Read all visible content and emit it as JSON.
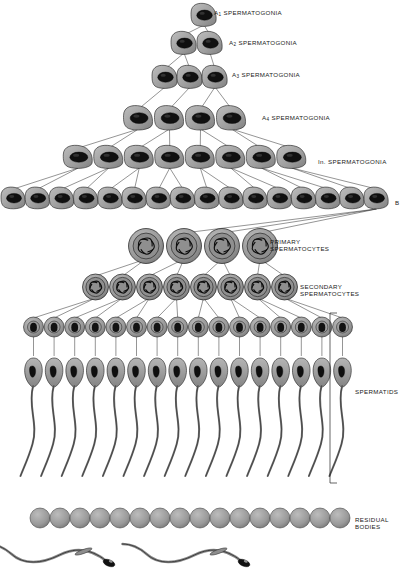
{
  "figure": {
    "style": {
      "cytoplasm_fill": "#9a9a9a",
      "cytoplasm_stroke": "#1a1a1a",
      "nucleus_fill": "#111111",
      "background": "#ffffff",
      "line_color": "#222222"
    }
  },
  "labels": [
    {
      "id": "a1",
      "text": "A",
      "sub": "1",
      "suffix": " SPERMATOGONIA",
      "x": 214,
      "y": 9,
      "lines": [
        "A₁  SPERMATOGONIA"
      ]
    },
    {
      "id": "a2",
      "text": "A",
      "sub": "2",
      "suffix": " SPERMATOGONIA",
      "x": 229,
      "y": 39,
      "lines": [
        "A₂  SPERMATOGONIA"
      ]
    },
    {
      "id": "a3",
      "text": "A",
      "sub": "3",
      "suffix": " SPERMATOGONIA",
      "x": 232,
      "y": 71,
      "lines": [
        "A₃  SPERMATOGONIA"
      ]
    },
    {
      "id": "a4",
      "text": "A",
      "sub": "4",
      "suffix": " SPERMATOGONIA",
      "x": 262,
      "y": 114,
      "lines": [
        "A₄  SPERMATOGONIA"
      ]
    },
    {
      "id": "intermediate",
      "text": "In.",
      "sub": "",
      "suffix": " SPERMATOGONIA",
      "x": 318,
      "y": 158,
      "lines": [
        "In.  SPERMATOGONIA"
      ]
    },
    {
      "id": "b",
      "text": "B",
      "sub": "",
      "suffix": "",
      "x": 395,
      "y": 199,
      "lines": [
        "B"
      ]
    }
  ],
  "stage_labels": [
    {
      "id": "primary-spermatocytes",
      "line1": "PRIMARY",
      "line2": "SPERMATOCYTES",
      "x": 270,
      "y": 238
    },
    {
      "id": "secondary-spermatocytes",
      "line1": "SECONDARY",
      "line2": "SPERMATOCYTES",
      "x": 300,
      "y": 283
    },
    {
      "id": "spermatids",
      "line1": "SPERMATIDS",
      "line2": "",
      "x": 355,
      "y": 388
    },
    {
      "id": "residual-bodies",
      "line1": "RESIDUAL",
      "line2": "BODIES",
      "x": 355,
      "y": 516
    }
  ],
  "rows": {
    "a1": {
      "label": "A1 spermatogonia",
      "count": 1,
      "cell_type": "oval-gonium",
      "y": 16,
      "spacing": 0,
      "center": 204
    },
    "a2": {
      "label": "A2 spermatogonia",
      "count": 2,
      "cell_type": "oval-gonium",
      "y": 44,
      "spacing": 26,
      "center": 197
    },
    "a3": {
      "label": "A3 spermatogonia",
      "count": 3,
      "cell_type": "oval-gonium",
      "y": 78,
      "spacing": 25,
      "center": 190
    },
    "a4": {
      "label": "A4 spermatogonia",
      "count": 4,
      "cell_type": "oval-gonium",
      "y": 119,
      "spacing": 31,
      "center": 185
    },
    "in": {
      "label": "Intermediate spermatogonia",
      "count": 8,
      "cell_type": "oval-gonium",
      "y": 158,
      "spacing": 30.5,
      "center": 185
    },
    "b": {
      "label": "B spermatogonia",
      "count": 16,
      "cell_type": "oval-gonium",
      "y": 199,
      "spacing": 24.2,
      "center": 195
    },
    "primary": {
      "label": "Primary spermatocytes",
      "count": 4,
      "cell_type": "round-meiotic",
      "y": 246,
      "spacing": 38,
      "center": 203
    },
    "secondary": {
      "label": "Secondary spermatocytes",
      "count": 8,
      "cell_type": "round-meiotic",
      "y": 287,
      "spacing": 27,
      "center": 190
    },
    "spermatid": {
      "label": "Round spermatids",
      "count": 16,
      "cell_type": "round-spermatid",
      "y": 327,
      "spacing": 20.6,
      "center": 188
    },
    "elongating": {
      "label": "Elongating spermatids",
      "count": 16,
      "cell_type": "elongating",
      "y": 372,
      "spacing": 20.6,
      "center": 188
    },
    "residual": {
      "label": "Residual bodies",
      "count": 16,
      "cell_type": "sphere",
      "y": 518,
      "spacing": 20.0,
      "center": 190
    },
    "free": {
      "label": "Free spermatozoa",
      "count": 2,
      "cell_type": "spermatozoon",
      "y": 562,
      "spacing": 135,
      "center": 175
    }
  },
  "bracket": {
    "id": "spermatid-bracket",
    "x": 330,
    "y_top": 313,
    "y_bottom": 483,
    "tick": 7
  }
}
